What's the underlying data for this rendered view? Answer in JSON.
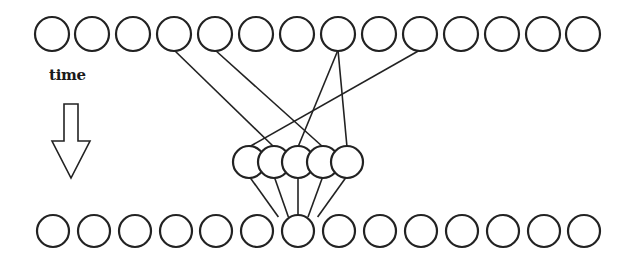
{
  "diagram": {
    "label": "time",
    "colors": {
      "stroke": "#222222",
      "fill": "#ffffff",
      "background": "#ffffff"
    },
    "top_row": {
      "name": "input-sequence",
      "y": 34,
      "r": 17,
      "x": [
        52,
        92,
        133,
        174,
        215,
        256,
        297,
        338,
        379,
        420,
        461,
        502,
        543,
        583
      ]
    },
    "middle_cluster": {
      "name": "hidden-units",
      "y": 162,
      "r": 16,
      "x": [
        249,
        274,
        298,
        323,
        347
      ]
    },
    "bottom_row": {
      "name": "output-sequence",
      "y": 231,
      "r": 16,
      "x": [
        53,
        94,
        135,
        176,
        216,
        257,
        298,
        339,
        380,
        421,
        462,
        503,
        544,
        584
      ]
    },
    "edges_top_to_middle": [
      {
        "from_top": 3,
        "to_middle": 1
      },
      {
        "from_top": 4,
        "to_middle": 3
      },
      {
        "from_top": 7,
        "to_middle": 2
      },
      {
        "from_top": 7,
        "to_middle": 4
      },
      {
        "from_top": 9,
        "to_middle": 0
      }
    ],
    "edges_middle_to_bottom": [
      {
        "from_middle": 0,
        "to_bottom": 6
      },
      {
        "from_middle": 1,
        "to_bottom": 6
      },
      {
        "from_middle": 2,
        "to_bottom": 6
      },
      {
        "from_middle": 3,
        "to_bottom": 6
      },
      {
        "from_middle": 4,
        "to_bottom": 6
      }
    ],
    "time_arrow": {
      "direction": "down",
      "points": "64,104 78,104 78,141 90,141 71,178 52,141 64,141"
    }
  }
}
